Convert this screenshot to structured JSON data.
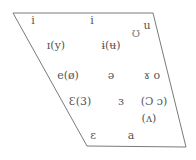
{
  "diagram": {
    "type": "vowel-chart-trapezoid",
    "orientation": "vertically-flipped",
    "line_color": "#7a7a7a",
    "text_color": "#555555",
    "trapezoid": {
      "top_left": [
        13,
        13
      ],
      "top_right": [
        153,
        13
      ],
      "bottom_right": [
        186,
        147
      ],
      "bottom_left": [
        87,
        146
      ]
    },
    "vowels": [
      {
        "label": "i",
        "x": 33,
        "y": 20
      },
      {
        "label": "i",
        "x": 92,
        "y": 20
      },
      {
        "label": "u",
        "x": 147,
        "y": 25
      },
      {
        "label": "Ʊ",
        "x": 136,
        "y": 33
      },
      {
        "label": "ɪ(y)",
        "x": 56,
        "y": 45
      },
      {
        "label": "ɨ(ʉ)",
        "x": 111,
        "y": 45
      },
      {
        "label": "e(ø)",
        "x": 68,
        "y": 75
      },
      {
        "label": "ə",
        "x": 111,
        "y": 75
      },
      {
        "label": "ɤ o",
        "x": 152,
        "y": 75
      },
      {
        "label": "Ɛ(3)",
        "x": 80,
        "y": 101
      },
      {
        "label": "ɜ",
        "x": 121,
        "y": 101
      },
      {
        "label": "(Ɔ  ɔ)",
        "x": 154,
        "y": 101
      },
      {
        "label": "(ʌ)",
        "x": 149,
        "y": 118
      },
      {
        "label": "ε",
        "x": 93,
        "y": 135
      },
      {
        "label": "a",
        "x": 131,
        "y": 135
      }
    ]
  }
}
